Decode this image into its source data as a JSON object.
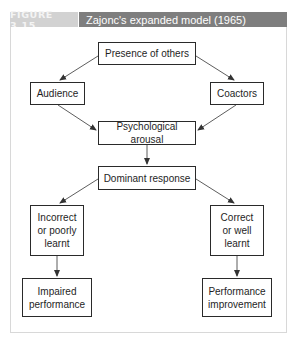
{
  "figure": {
    "label": "FIGURE 3.15",
    "title": "Zajonc's expanded model (1965)"
  },
  "nodes": {
    "presence": "Presence of others",
    "audience": "Audience",
    "coactors": "Coactors",
    "arousal": "Psychological arousal",
    "dominant": "Dominant response",
    "incorrect": "Incorrect\nor poorly\nlearnt",
    "correct": "Correct\nor well\nlearnt",
    "impaired": "Impaired\nperformance",
    "improvement": "Performance\nimprovement"
  },
  "edges": [
    {
      "from": "presence",
      "to": "audience"
    },
    {
      "from": "presence",
      "to": "coactors"
    },
    {
      "from": "audience",
      "to": "arousal"
    },
    {
      "from": "coactors",
      "to": "arousal"
    },
    {
      "from": "arousal",
      "to": "dominant"
    },
    {
      "from": "dominant",
      "to": "incorrect"
    },
    {
      "from": "dominant",
      "to": "correct"
    },
    {
      "from": "incorrect",
      "to": "impaired"
    },
    {
      "from": "correct",
      "to": "improvement"
    }
  ],
  "colors": {
    "label_bg": "#d2d2d2",
    "title_bg": "#7e7e7e",
    "box_border": "#2a2a2a",
    "arrow": "#333333"
  }
}
